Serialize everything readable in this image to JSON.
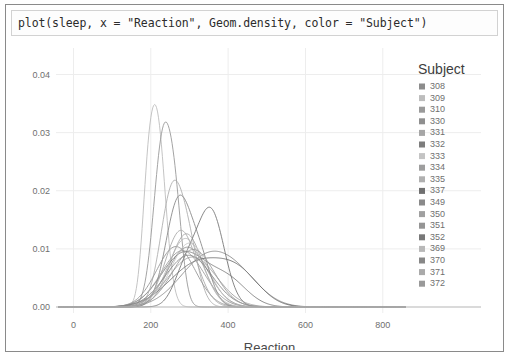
{
  "code_cell": {
    "source": "plot(sleep, x = \"Reaction\", Geom.density, color = \"Subject\")"
  },
  "chart_data": {
    "type": "line",
    "title": "",
    "xlabel": "Reaction",
    "ylabel": "",
    "xlim": [
      -40,
      860
    ],
    "ylim": [
      0,
      0.0425
    ],
    "xticks": [
      "0",
      "200",
      "400",
      "600",
      "800"
    ],
    "xtick_values": [
      0,
      200,
      400,
      600,
      800
    ],
    "yticks": [
      "0.00",
      "0.01",
      "0.02",
      "0.03",
      "0.04"
    ],
    "ytick_values": [
      0.0,
      0.01,
      0.02,
      0.03,
      0.04
    ],
    "grid": true,
    "legend_position": "right",
    "legend_title": "Subject",
    "series": [
      {
        "name": "308",
        "color": "#8c8c8c",
        "mean": 340,
        "sd": 68,
        "peak": 0.0079
      },
      {
        "name": "309",
        "color": "#bdbdbd",
        "mean": 215,
        "sd": 22,
        "peak": 0.0325
      },
      {
        "name": "310",
        "color": "#9a9a9a",
        "mean": 232,
        "sd": 24,
        "peak": 0.029
      },
      {
        "name": "330",
        "color": "#8f8f8f",
        "mean": 295,
        "sd": 52,
        "peak": 0.0103
      },
      {
        "name": "331",
        "color": "#a6a6a6",
        "mean": 292,
        "sd": 42,
        "peak": 0.0126
      },
      {
        "name": "332",
        "color": "#7d7d7d",
        "mean": 285,
        "sd": 58,
        "peak": 0.0092
      },
      {
        "name": "333",
        "color": "#c4c4c4",
        "mean": 300,
        "sd": 48,
        "peak": 0.011
      },
      {
        "name": "334",
        "color": "#9e9e9e",
        "mean": 282,
        "sd": 55,
        "peak": 0.0097
      },
      {
        "name": "335",
        "color": "#b0b0b0",
        "mean": 255,
        "sd": 30,
        "peak": 0.0196
      },
      {
        "name": "337",
        "color": "#707070",
        "mean": 320,
        "sd": 72,
        "peak": 0.0074
      },
      {
        "name": "349",
        "color": "#8a8a8a",
        "mean": 272,
        "sd": 33,
        "peak": 0.0183
      },
      {
        "name": "350",
        "color": "#a0a0a0",
        "mean": 308,
        "sd": 62,
        "peak": 0.0086
      },
      {
        "name": "351",
        "color": "#959595",
        "mean": 265,
        "sd": 50,
        "peak": 0.0104
      },
      {
        "name": "352",
        "color": "#787878",
        "mean": 355,
        "sd": 35,
        "peak": 0.0165
      },
      {
        "name": "369",
        "color": "#b8b8b8",
        "mean": 290,
        "sd": 45,
        "peak": 0.0118
      },
      {
        "name": "370",
        "color": "#878787",
        "mean": 298,
        "sd": 60,
        "peak": 0.0089
      },
      {
        "name": "371",
        "color": "#aaaaaa",
        "mean": 278,
        "sd": 40,
        "peak": 0.0132
      },
      {
        "name": "372",
        "color": "#999999",
        "mean": 310,
        "sd": 54,
        "peak": 0.0099
      }
    ],
    "extra_bumps": [
      {
        "series": "309",
        "mean": 190,
        "sd": 14,
        "peak": 0.0088
      },
      {
        "series": "310",
        "mean": 265,
        "sd": 18,
        "peak": 0.0115
      },
      {
        "series": "335",
        "mean": 300,
        "sd": 26,
        "peak": 0.008
      },
      {
        "series": "349",
        "mean": 330,
        "sd": 28,
        "peak": 0.007
      },
      {
        "series": "352",
        "mean": 290,
        "sd": 30,
        "peak": 0.0062
      },
      {
        "series": "337",
        "mean": 430,
        "sd": 55,
        "peak": 0.0048
      },
      {
        "series": "332",
        "mean": 400,
        "sd": 50,
        "peak": 0.0044
      },
      {
        "series": "308",
        "mean": 430,
        "sd": 60,
        "peak": 0.004
      }
    ]
  },
  "legend": {
    "title": "Subject",
    "items": [
      {
        "label": "308",
        "color": "#8c8c8c"
      },
      {
        "label": "309",
        "color": "#bdbdbd"
      },
      {
        "label": "310",
        "color": "#9a9a9a"
      },
      {
        "label": "330",
        "color": "#8f8f8f"
      },
      {
        "label": "331",
        "color": "#a6a6a6"
      },
      {
        "label": "332",
        "color": "#7d7d7d"
      },
      {
        "label": "333",
        "color": "#c4c4c4"
      },
      {
        "label": "334",
        "color": "#9e9e9e"
      },
      {
        "label": "335",
        "color": "#b0b0b0"
      },
      {
        "label": "337",
        "color": "#707070"
      },
      {
        "label": "349",
        "color": "#8a8a8a"
      },
      {
        "label": "350",
        "color": "#a0a0a0"
      },
      {
        "label": "351",
        "color": "#959595"
      },
      {
        "label": "352",
        "color": "#787878"
      },
      {
        "label": "369",
        "color": "#b8b8b8"
      },
      {
        "label": "370",
        "color": "#878787"
      },
      {
        "label": "371",
        "color": "#aaaaaa"
      },
      {
        "label": "372",
        "color": "#999999"
      }
    ]
  }
}
